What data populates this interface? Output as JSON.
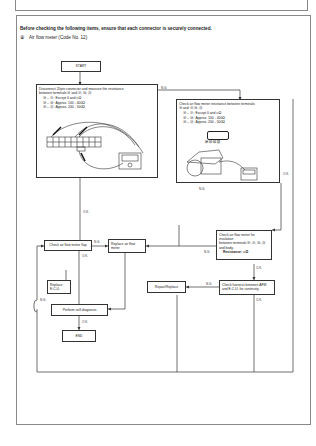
{
  "header": {
    "instruction": "Before checking the following items, ensure that each connector is securely connected.",
    "section_num": "⑧",
    "section_title": "Air flow meter (Code No. 12)"
  },
  "flow": {
    "start": "START",
    "step1": {
      "line1": "Disconnect 20pin connector and measure the resistance",
      "line2": "between terminals ⑳ and ㉑, ㉒, ㉓",
      "rows": [
        "⑳ – ㉑ : Except 0 and ∞Ω",
        "⑳ – ㉒ : Approx. 100 - 400Ω",
        "⑳ – ㉓ : Approx. 200 - 500Ω"
      ]
    },
    "step2": {
      "line1": "Check air flow meter resistance between terminals",
      "line2": "⑳ and ㉑, ㉒, ㉓",
      "rows": [
        "⑳ – ㉑ : Except 0 and ∞Ω",
        "⑳ – ㉒ : Approx. 100 - 400Ω",
        "⑳ – ㉓ : Approx. 200 - 500Ω"
      ],
      "terminals": "⑳ ㉑ ㉒ ㉓"
    },
    "check_flap": "Check air flow meter flap",
    "replace_afm": "Replace air flow meter",
    "check_insulation": {
      "line1": "Check air flow meter for insulation",
      "line2": "between terminals ⑳, ㉑, ㉒, ㉓",
      "line3": "and body.",
      "line4": "Resistance: ∞Ω"
    },
    "replace_ecu": "Replace E.C.U.",
    "self_diag": "Perform self-diagnosis",
    "end": "END",
    "repair": "Repair/Replace",
    "check_harness": "Check harness between AFM and E.C.U. for continuity."
  },
  "labels": {
    "ok": "O.K.",
    "ng": "N.G."
  }
}
